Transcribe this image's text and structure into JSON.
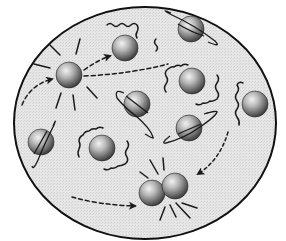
{
  "diagram": {
    "title": "",
    "colors": {
      "container_fill": "#e4e4e4",
      "container_stroke": "#111111",
      "molecule_light": "#d8d8d8",
      "molecule_dark": "#3a3a3a",
      "line": "#1a1a1a"
    },
    "container": {
      "cx": 145,
      "cy": 123,
      "rx": 131,
      "ry": 116
    },
    "molecules": [
      {
        "id": "vibrating-left",
        "x": 69,
        "y": 75,
        "r": 13,
        "motion": "vibration"
      },
      {
        "id": "top-middle",
        "x": 125,
        "y": 48,
        "r": 13,
        "motion": "translation"
      },
      {
        "id": "top-right-rotating",
        "x": 191,
        "y": 29,
        "r": 13,
        "motion": "rotation"
      },
      {
        "id": "center-wiggle",
        "x": 192,
        "y": 81,
        "r": 13,
        "motion": "vibration"
      },
      {
        "id": "right-edge",
        "x": 255,
        "y": 104,
        "r": 13,
        "motion": "vibration"
      },
      {
        "id": "middle-rotating",
        "x": 137,
        "y": 104,
        "r": 13,
        "motion": "rotation"
      },
      {
        "id": "right-rotating",
        "x": 189,
        "y": 128,
        "r": 13,
        "motion": "rotation"
      },
      {
        "id": "left-rotating",
        "x": 41,
        "y": 142,
        "r": 13,
        "motion": "rotation"
      },
      {
        "id": "lower-wiggle",
        "x": 102,
        "y": 148,
        "r": 13,
        "motion": "vibration"
      },
      {
        "id": "collision-a",
        "x": 152,
        "y": 193,
        "r": 13,
        "motion": "collision"
      },
      {
        "id": "collision-b",
        "x": 175,
        "y": 186,
        "r": 13,
        "motion": "collision"
      }
    ]
  }
}
